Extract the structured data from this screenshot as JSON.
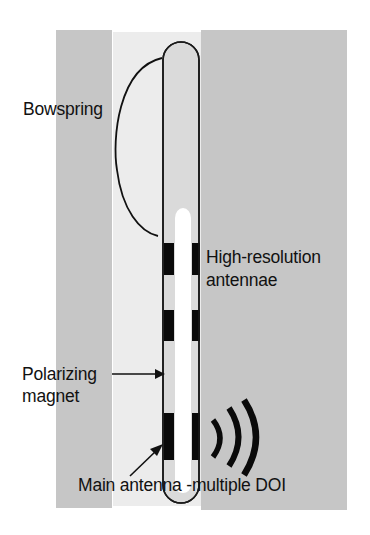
{
  "diagram": {
    "type": "borehole-tool-schematic",
    "colors": {
      "formation": "#c6c6c6",
      "borehole": "#ececec",
      "tool_body": "#dadada",
      "inner_channel": "#ffffff",
      "antenna": "#0a0a0a",
      "outline": "#1a1a1a"
    },
    "labels": {
      "bowspring": "Bowspring",
      "high_res_line1": "High-resolution",
      "high_res_line2": "antennae",
      "polarizing_line1": "Polarizing",
      "polarizing_line2": "magnet",
      "main_antenna": "Main antenna -multiple DOI"
    },
    "components": [
      {
        "name": "Bowspring"
      },
      {
        "name": "High-resolution antennae",
        "count": 2
      },
      {
        "name": "Polarizing magnet"
      },
      {
        "name": "Main antenna",
        "note": "multiple DOI"
      }
    ]
  }
}
